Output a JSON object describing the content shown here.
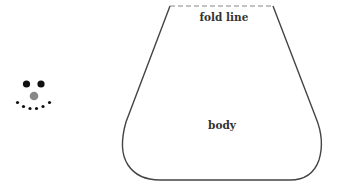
{
  "diagram": {
    "labels": {
      "fold_line": "fold line",
      "body": "body"
    },
    "colors": {
      "outline": "#444444",
      "fold_dash": "#888888",
      "eyes": "#111111",
      "nose": "#888888",
      "mouth": "#111111"
    }
  }
}
